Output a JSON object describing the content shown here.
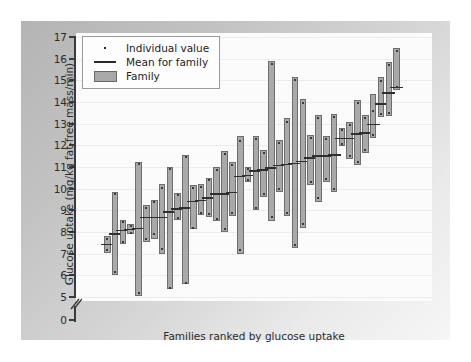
{
  "figure": {
    "panel_color": "#c0c0c0",
    "plot_background": "#fbfbfb",
    "bar_fill": "#a9a9a9",
    "bar_stroke": "#6e6e6e",
    "mean_color": "#2f2f2f",
    "dot_color": "#3a3a3a"
  },
  "legend": {
    "items": [
      {
        "key": "dot",
        "label": "Individual value"
      },
      {
        "key": "line",
        "label": "Mean for family"
      },
      {
        "key": "box",
        "label": "Family"
      }
    ]
  },
  "chart_data": {
    "type": "bar",
    "title": "",
    "subtitle": "",
    "xlabel": "Families ranked by glucose uptake",
    "ylabel": "Glucose uptake (mg/kg fat-free mass/min)",
    "ylim": [
      5,
      17
    ],
    "yticks": [
      0,
      5,
      6,
      7,
      8,
      9,
      10,
      11,
      12,
      13,
      14,
      15,
      16,
      17
    ],
    "ytick_labels": [
      "0",
      "5",
      "6",
      "7",
      "8",
      "9",
      "10",
      "11",
      "12",
      "13",
      "14",
      "15",
      "16",
      "17"
    ],
    "axis_break": true,
    "axis_break_between": [
      0,
      5
    ],
    "xticks": [],
    "xtick_labels": [],
    "grid": true,
    "grid_axis": "y",
    "legend_position": "upper left",
    "series": [
      {
        "name": "Family",
        "description": "Vertical range bar per family: low to high individual values, with horizontal mean line and individual value dots.",
        "families": [
          {
            "rank": 1,
            "low": 7.05,
            "high": 7.8,
            "mean": 7.45,
            "values": [
              7.15,
              7.7
            ]
          },
          {
            "rank": 2,
            "low": 6.0,
            "high": 9.85,
            "mean": 7.95,
            "values": [
              6.15,
              9.75
            ]
          },
          {
            "rank": 3,
            "low": 7.45,
            "high": 8.55,
            "mean": 8.1,
            "values": [
              7.55,
              8.45
            ]
          },
          {
            "rank": 4,
            "low": 7.9,
            "high": 8.35,
            "mean": 8.15,
            "values": [
              7.95,
              8.3
            ]
          },
          {
            "rank": 5,
            "low": 5.05,
            "high": 11.25,
            "mean": 8.2,
            "values": [
              5.2,
              11.15
            ]
          },
          {
            "rank": 6,
            "low": 7.55,
            "high": 9.25,
            "mean": 8.7,
            "values": [
              7.7,
              9.1
            ]
          },
          {
            "rank": 7,
            "low": 7.7,
            "high": 9.5,
            "mean": 8.7,
            "values": [
              7.9,
              9.4
            ]
          },
          {
            "rank": 8,
            "low": 7.0,
            "high": 10.2,
            "mean": 8.7,
            "values": [
              7.2,
              10.05
            ]
          },
          {
            "rank": 9,
            "low": 5.35,
            "high": 11.0,
            "mean": 8.95,
            "values": [
              5.4,
              10.9
            ]
          },
          {
            "rank": 10,
            "low": 8.55,
            "high": 9.8,
            "mean": 9.1,
            "values": [
              8.65,
              9.7
            ]
          },
          {
            "rank": 11,
            "low": 5.6,
            "high": 11.55,
            "mean": 9.15,
            "values": [
              5.65,
              11.45
            ]
          },
          {
            "rank": 12,
            "low": 8.15,
            "high": 10.15,
            "mean": 9.45,
            "values": [
              8.2,
              10.05
            ]
          },
          {
            "rank": 13,
            "low": 8.8,
            "high": 10.2,
            "mean": 9.5,
            "values": [
              8.9,
              10.1
            ]
          },
          {
            "rank": 14,
            "low": 8.7,
            "high": 10.5,
            "mean": 9.6,
            "values": [
              8.85,
              10.4
            ]
          },
          {
            "rank": 15,
            "low": 8.5,
            "high": 11.0,
            "mean": 9.8,
            "values": [
              8.6,
              10.85
            ]
          },
          {
            "rank": 16,
            "low": 8.0,
            "high": 11.75,
            "mean": 9.8,
            "values": [
              8.15,
              11.6
            ]
          },
          {
            "rank": 17,
            "low": 8.75,
            "high": 11.25,
            "mean": 9.85,
            "values": [
              8.9,
              11.1
            ]
          },
          {
            "rank": 18,
            "low": 7.0,
            "high": 12.45,
            "mean": 10.6,
            "values": [
              7.15,
              12.2
            ]
          },
          {
            "rank": 19,
            "low": 10.3,
            "high": 11.0,
            "mean": 10.65,
            "values": [
              10.4,
              10.9
            ]
          },
          {
            "rank": 20,
            "low": 9.0,
            "high": 12.45,
            "mean": 10.85,
            "values": [
              9.1,
              12.3
            ]
          },
          {
            "rank": 21,
            "low": 9.6,
            "high": 11.8,
            "mean": 10.9,
            "values": [
              9.75,
              11.65
            ]
          },
          {
            "rank": 22,
            "low": 8.5,
            "high": 15.9,
            "mean": 11.0,
            "values": [
              8.7,
              15.75
            ]
          },
          {
            "rank": 23,
            "low": 9.85,
            "high": 12.25,
            "mean": 11.1,
            "values": [
              10.0,
              12.1
            ]
          },
          {
            "rank": 24,
            "low": 8.75,
            "high": 13.25,
            "mean": 11.15,
            "values": [
              8.9,
              13.1
            ]
          },
          {
            "rank": 25,
            "low": 7.25,
            "high": 15.15,
            "mean": 11.2,
            "values": [
              7.4,
              15.0
            ]
          },
          {
            "rank": 26,
            "low": 8.2,
            "high": 14.15,
            "mean": 11.3,
            "values": [
              8.35,
              13.95
            ]
          },
          {
            "rank": 27,
            "low": 10.15,
            "high": 12.5,
            "mean": 11.45,
            "values": [
              10.3,
              12.35
            ]
          },
          {
            "rank": 28,
            "low": 9.4,
            "high": 13.4,
            "mean": 11.55,
            "values": [
              9.55,
              13.25
            ]
          },
          {
            "rank": 29,
            "low": 10.3,
            "high": 12.45,
            "mean": 11.55,
            "values": [
              10.45,
              12.3
            ]
          },
          {
            "rank": 30,
            "low": 9.85,
            "high": 13.45,
            "mean": 11.6,
            "values": [
              10.0,
              13.3
            ]
          },
          {
            "rank": 31,
            "low": 11.95,
            "high": 12.8,
            "mean": 12.35,
            "values": [
              12.05,
              12.7
            ]
          },
          {
            "rank": 32,
            "low": 11.35,
            "high": 13.1,
            "mean": 12.35,
            "values": [
              11.5,
              12.95
            ]
          },
          {
            "rank": 33,
            "low": 11.1,
            "high": 14.1,
            "mean": 12.55,
            "values": [
              11.25,
              13.95
            ]
          },
          {
            "rank": 34,
            "low": 11.65,
            "high": 13.4,
            "mean": 12.6,
            "values": [
              11.8,
              13.25
            ]
          },
          {
            "rank": 35,
            "low": 12.35,
            "high": 14.35,
            "mean": 13.0,
            "values": [
              12.5,
              13.6
            ]
          },
          {
            "rank": 36,
            "low": 13.3,
            "high": 15.15,
            "mean": 13.95,
            "values": [
              13.45,
              14.95
            ]
          },
          {
            "rank": 37,
            "low": 13.35,
            "high": 15.85,
            "mean": 14.45,
            "values": [
              13.5,
              15.7
            ]
          },
          {
            "rank": 38,
            "low": 14.55,
            "high": 16.5,
            "mean": 14.7,
            "values": [
              14.7,
              16.35
            ]
          }
        ]
      }
    ]
  }
}
